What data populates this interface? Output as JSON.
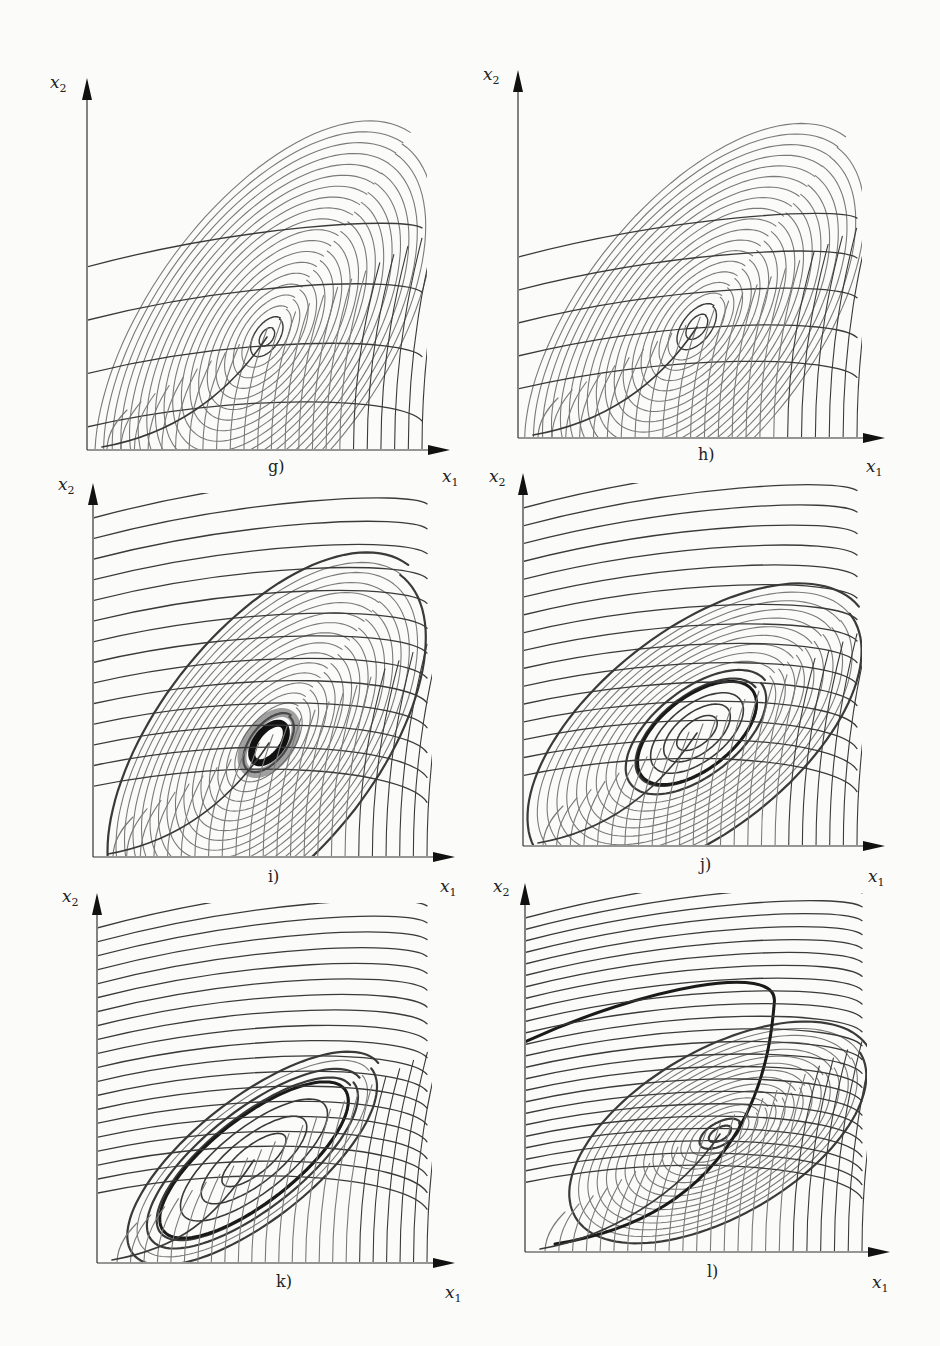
{
  "figure": {
    "panels": [
      {
        "id": "g",
        "label": "g)",
        "x_axis": "x",
        "x_sub": "1",
        "y_axis": "x",
        "y_sub": "2",
        "origin": [
          87,
          450
        ],
        "x_end": 450,
        "y_top": 78,
        "caption_pos": [
          268,
          457
        ],
        "xl_pos": [
          442,
          466
        ],
        "yl_pos": [
          50,
          72
        ],
        "center": [
          267,
          337
        ],
        "type": "stable-focus",
        "rx": 10,
        "ry": 6,
        "tilt": -55,
        "rings": 20,
        "ring_step": 9.5,
        "flow_lines": 6,
        "spiral_width": "thin"
      },
      {
        "id": "h",
        "label": "h)",
        "x_axis": "x",
        "x_sub": "1",
        "y_axis": "x",
        "y_sub": "2",
        "origin": [
          518,
          438
        ],
        "x_end": 885,
        "y_top": 70,
        "caption_pos": [
          698,
          445
        ],
        "xl_pos": [
          866,
          456
        ],
        "yl_pos": [
          483,
          64
        ],
        "center": [
          697,
          327
        ],
        "type": "stable-focus",
        "rx": 14,
        "ry": 8,
        "tilt": -52,
        "rings": 19,
        "ring_step": 9.5,
        "flow_lines": 9,
        "spiral_width": "medium"
      },
      {
        "id": "i",
        "label": "i)",
        "x_axis": "x",
        "x_sub": "1",
        "y_axis": "x",
        "y_sub": "2",
        "origin": [
          93,
          857
        ],
        "x_end": 455,
        "y_top": 483,
        "caption_pos": [
          268,
          867
        ],
        "xl_pos": [
          440,
          876
        ],
        "yl_pos": [
          58,
          474
        ],
        "center": [
          269,
          743
        ],
        "type": "small-limit-cycle",
        "rx": 22,
        "ry": 12,
        "tilt": -52,
        "rings": 18,
        "ring_step": 9,
        "flow_lines": 14,
        "spiral_width": "thick"
      },
      {
        "id": "j",
        "label": "j)",
        "x_axis": "x",
        "x_sub": "1",
        "y_axis": "x",
        "y_sub": "2",
        "origin": [
          523,
          846
        ],
        "x_end": 885,
        "y_top": 473,
        "caption_pos": [
          700,
          855
        ],
        "xl_pos": [
          868,
          866
        ],
        "yl_pos": [
          489,
          466
        ],
        "center": [
          697,
          733
        ],
        "type": "limit-cycle",
        "rx": 70,
        "ry": 36,
        "tilt": -38,
        "rings": 12,
        "ring_step": 9,
        "flow_lines": 16,
        "spiral_width": "thick"
      },
      {
        "id": "k",
        "label": "k)",
        "x_axis": "x",
        "x_sub": "1",
        "y_axis": "x",
        "y_sub": "2",
        "origin": [
          97,
          1263
        ],
        "x_end": 455,
        "y_top": 893,
        "caption_pos": [
          276,
          1272
        ],
        "xl_pos": [
          445,
          1282
        ],
        "yl_pos": [
          62,
          886
        ],
        "center": [
          254,
          1160
        ],
        "type": "large-limit-cycle",
        "rx": 115,
        "ry": 42,
        "tilt": -38,
        "rings": 4,
        "ring_step": 9,
        "flow_lines": 20,
        "spiral_width": "thick"
      },
      {
        "id": "l",
        "label": "l)",
        "x_axis": "x",
        "x_sub": "1",
        "y_axis": "x",
        "y_sub": "2",
        "origin": [
          525,
          1252
        ],
        "x_end": 890,
        "y_top": 883,
        "caption_pos": [
          707,
          1262
        ],
        "xl_pos": [
          872,
          1272
        ],
        "yl_pos": [
          493,
          876
        ],
        "center": [
          720,
          1134
        ],
        "type": "separatrix-loop",
        "rx": 12,
        "ry": 6,
        "tilt": -30,
        "rings": 16,
        "ring_step": 8,
        "flow_lines": 24,
        "spiral_width": "thick"
      }
    ]
  },
  "colors": {
    "background": "#fbfbfa",
    "curve_dark": "#3a3a3a",
    "curve_light": "#7a7a7a",
    "axis": "#333333",
    "text": "#222222"
  }
}
